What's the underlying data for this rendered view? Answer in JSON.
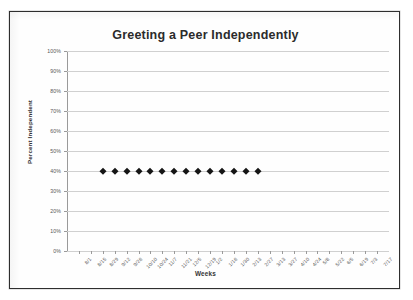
{
  "chart_data": {
    "type": "scatter",
    "title": "Greeting a Peer Independently",
    "xlabel": "Weeks",
    "ylabel": "Percent Independent",
    "ylim": [
      0,
      100
    ],
    "ytick_labels": [
      "0%",
      "10%",
      "20%",
      "30%",
      "40%",
      "50%",
      "60%",
      "70%",
      "80%",
      "90%",
      "100%"
    ],
    "ytick_values": [
      0,
      10,
      20,
      30,
      40,
      50,
      60,
      70,
      80,
      90,
      100
    ],
    "categories": [
      "8/1",
      "8/15",
      "8/29",
      "9/12",
      "9/26",
      "10/10",
      "10/24",
      "11/7",
      "11/21",
      "12/5",
      "12/19",
      "1/2",
      "1/16",
      "1/30",
      "2/13",
      "2/27",
      "3/13",
      "3/27",
      "4/10",
      "4/24",
      "5/8",
      "5/22",
      "6/5",
      "6/19",
      "7/3",
      "7/17"
    ],
    "series": [
      {
        "name": "Percent Independent",
        "marker": "diamond",
        "color": "#151515",
        "points": [
          {
            "x": "8/29",
            "y": 40
          },
          {
            "x": "9/12",
            "y": 40
          },
          {
            "x": "9/26",
            "y": 40
          },
          {
            "x": "10/10",
            "y": 40
          },
          {
            "x": "10/24",
            "y": 40
          },
          {
            "x": "11/7",
            "y": 40
          },
          {
            "x": "11/21",
            "y": 40
          },
          {
            "x": "12/5",
            "y": 40
          },
          {
            "x": "12/19",
            "y": 40
          },
          {
            "x": "1/2",
            "y": 40
          },
          {
            "x": "1/16",
            "y": 40
          },
          {
            "x": "1/30",
            "y": 40
          },
          {
            "x": "2/13",
            "y": 40
          },
          {
            "x": "2/27",
            "y": 40
          }
        ]
      }
    ],
    "grid": {
      "horizontal": true,
      "vertical": false
    },
    "legend": null,
    "gridline_color": "#d0d0d0",
    "axis_color": "#9a9a9a",
    "background_color": "#ffffff",
    "border_color": "#2e2e2e"
  }
}
